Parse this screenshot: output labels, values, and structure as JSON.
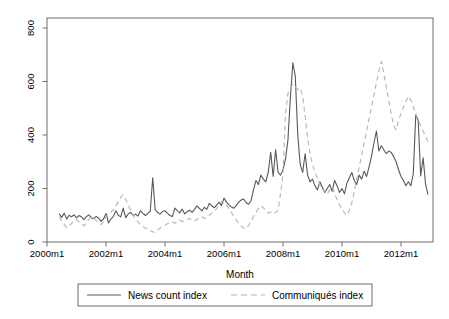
{
  "figure": {
    "xlabel": "Month",
    "colors": {
      "background": "#ffffff",
      "axis": "#6e6e6e",
      "text": "#000000",
      "news_line": "#585858",
      "communiques_line": "#b4b4b4"
    }
  },
  "chart_data": {
    "type": "line",
    "xlabel": "Month",
    "x_tick_labels": [
      "2000m1",
      "2002m1",
      "2004m1",
      "2006m1",
      "2008m1",
      "2010m1",
      "2012m1"
    ],
    "x_tick_interval_months": 24,
    "y_ticks": [
      0,
      200,
      400,
      600,
      800
    ],
    "ylim": [
      0,
      838
    ],
    "grid": false,
    "legend_position": "bottom",
    "x_start": "2000m6",
    "x_end": "2012m12",
    "series": [
      {
        "name": "News count index",
        "style": "solid",
        "color": "#585858",
        "start_month": "2000m6",
        "values": [
          105,
          92,
          108,
          86,
          100,
          94,
          102,
          90,
          99,
          94,
          84,
          95,
          101,
          91,
          87,
          96,
          89,
          77,
          86,
          107,
          71,
          86,
          96,
          117,
          100,
          94,
          127,
          91,
          104,
          111,
          99,
          104,
          97,
          117,
          107,
          99,
          107,
          114,
          240,
          121,
          111,
          104,
          114,
          117,
          107,
          99,
          95,
          127,
          117,
          109,
          123,
          105,
          113,
          119,
          111,
          122,
          135,
          126,
          116,
          130,
          122,
          144,
          136,
          128,
          138,
          148,
          136,
          164,
          149,
          139,
          131,
          126,
          137,
          149,
          157,
          161,
          147,
          141,
          155,
          195,
          230,
          215,
          250,
          235,
          225,
          260,
          335,
          245,
          345,
          260,
          250,
          270,
          310,
          380,
          540,
          670,
          620,
          400,
          290,
          260,
          330,
          250,
          225,
          235,
          210,
          195,
          225,
          205,
          185,
          200,
          215,
          190,
          230,
          210,
          185,
          200,
          180,
          220,
          240,
          260,
          230,
          215,
          250,
          235,
          265,
          245,
          280,
          320,
          370,
          415,
          340,
          360,
          345,
          330,
          340,
          335,
          320,
          300,
          270,
          245,
          230,
          210,
          225,
          210,
          255,
          475,
          455,
          247,
          315,
          215,
          177
        ]
      },
      {
        "name": "Communiqués index",
        "style": "dashed",
        "color": "#b4b4b4",
        "start_month": "2000m6",
        "values": [
          95,
          80,
          65,
          54,
          60,
          70,
          78,
          85,
          75,
          68,
          60,
          72,
          85,
          95,
          88,
          80,
          72,
          65,
          75,
          95,
          105,
          112,
          120,
          135,
          150,
          168,
          176,
          160,
          140,
          120,
          100,
          85,
          75,
          65,
          58,
          52,
          48,
          42,
          38,
          36,
          45,
          52,
          58,
          62,
          68,
          72,
          75,
          70,
          78,
          82,
          76,
          80,
          85,
          88,
          82,
          78,
          85,
          90,
          95,
          88,
          92,
          100,
          108,
          115,
          125,
          140,
          152,
          150,
          138,
          125,
          110,
          95,
          82,
          70,
          60,
          52,
          50,
          62,
          78,
          95,
          110,
          125,
          135,
          128,
          118,
          108,
          112,
          105,
          110,
          120,
          180,
          250,
          480,
          555,
          575,
          590,
          580,
          570,
          575,
          545,
          470,
          390,
          330,
          290,
          262,
          238,
          215,
          198,
          188,
          178,
          196,
          206,
          182,
          158,
          138,
          125,
          108,
          100,
          118,
          146,
          190,
          235,
          280,
          325,
          370,
          415,
          460,
          505,
          550,
          595,
          640,
          675,
          630,
          580,
          530,
          480,
          435,
          420,
          455,
          480,
          505,
          525,
          545,
          530,
          505,
          480,
          455,
          435,
          415,
          395,
          375
        ]
      }
    ]
  }
}
